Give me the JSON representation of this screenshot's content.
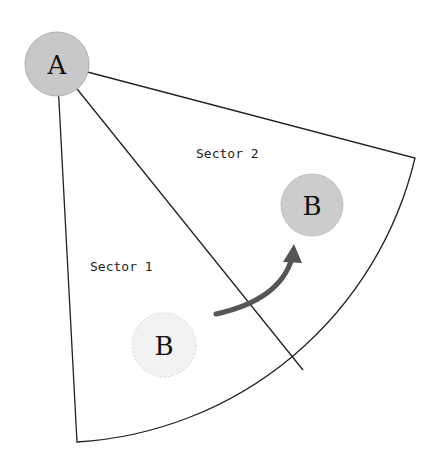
{
  "diagram": {
    "sectors": [
      {
        "label": "Sector 1"
      },
      {
        "label": "Sector 2"
      }
    ],
    "nodes": {
      "a": {
        "label": "A",
        "fill": "#c8c8c8"
      },
      "b_target": {
        "label": "B",
        "fill": "#c8c8c8"
      },
      "b_origin": {
        "label": "B",
        "fill": "#f0f0f0"
      }
    },
    "arrow_color": "#555555",
    "line_color": "#222222"
  }
}
